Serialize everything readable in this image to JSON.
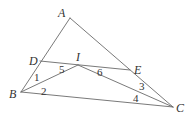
{
  "diagram": {
    "type": "geometry",
    "points": {
      "A": {
        "label": "A",
        "x": 70,
        "y": 18
      },
      "B": {
        "label": "B",
        "x": 21,
        "y": 92
      },
      "C": {
        "label": "C",
        "x": 173,
        "y": 107
      },
      "D": {
        "label": "D",
        "x": 40,
        "y": 61
      },
      "E": {
        "label": "E",
        "x": 130,
        "y": 70
      },
      "I": {
        "label": "I",
        "x": 78,
        "y": 65
      }
    },
    "segments": [
      [
        "A",
        "B"
      ],
      [
        "A",
        "C"
      ],
      [
        "B",
        "C"
      ],
      [
        "D",
        "E"
      ],
      [
        "B",
        "I"
      ],
      [
        "I",
        "C"
      ]
    ],
    "angle_labels": [
      {
        "label": "1",
        "x": 34,
        "y": 81
      },
      {
        "label": "2",
        "x": 41,
        "y": 95
      },
      {
        "label": "5",
        "x": 59,
        "y": 73
      },
      {
        "label": "6",
        "x": 97,
        "y": 76
      },
      {
        "label": "3",
        "x": 139,
        "y": 90
      },
      {
        "label": "4",
        "x": 133,
        "y": 102
      }
    ]
  }
}
